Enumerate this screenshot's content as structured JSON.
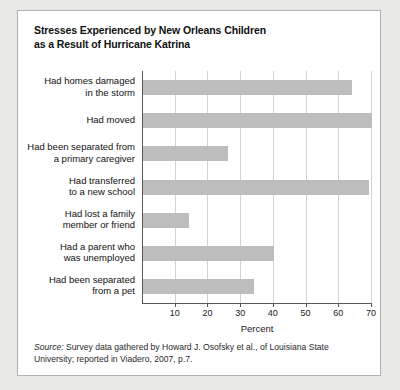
{
  "chart_data": {
    "type": "bar",
    "orientation": "horizontal",
    "title": "Stresses Experienced by New Orleans Children as a Result of Hurricane Katrina",
    "title_lines": [
      "Stresses Experienced by New Orleans Children",
      "as a Result of Hurricane Katrina"
    ],
    "categories": [
      "Had homes damaged in the storm",
      "Had moved",
      "Had been separated from a primary caregiver",
      "Had transferred to a new school",
      "Had lost a family member or friend",
      "Had a parent who was unemployed",
      "Had been separated from a pet"
    ],
    "category_lines": [
      [
        "Had homes damaged",
        "in the storm"
      ],
      [
        "Had moved"
      ],
      [
        "Had been separated from",
        "a primary caregiver"
      ],
      [
        "Had transferred",
        "to a new school"
      ],
      [
        "Had lost a family",
        "member or friend"
      ],
      [
        "Had a parent who",
        "was unemployed"
      ],
      [
        "Had been separated",
        "from a pet"
      ]
    ],
    "values": [
      64,
      70,
      26,
      69,
      14,
      40,
      34
    ],
    "xlabel": "Percent",
    "ylabel": "",
    "xlim": [
      0,
      70
    ],
    "xticks": [
      10,
      20,
      30,
      40,
      50,
      60,
      70
    ],
    "xtick_labels": [
      "10",
      "20",
      "30",
      "40",
      "50",
      "60",
      "70"
    ],
    "grid": true,
    "legend": false,
    "bar_color": "#bdbdbd",
    "grid_color": "#d2d2d2",
    "axis_color": "#5a5a5a"
  },
  "source": {
    "label": "Source:",
    "text": " Survey data gathered by Howard J. Osofsky et al., of Louisiana State University; reported in Viadero, 2007, p.7."
  }
}
